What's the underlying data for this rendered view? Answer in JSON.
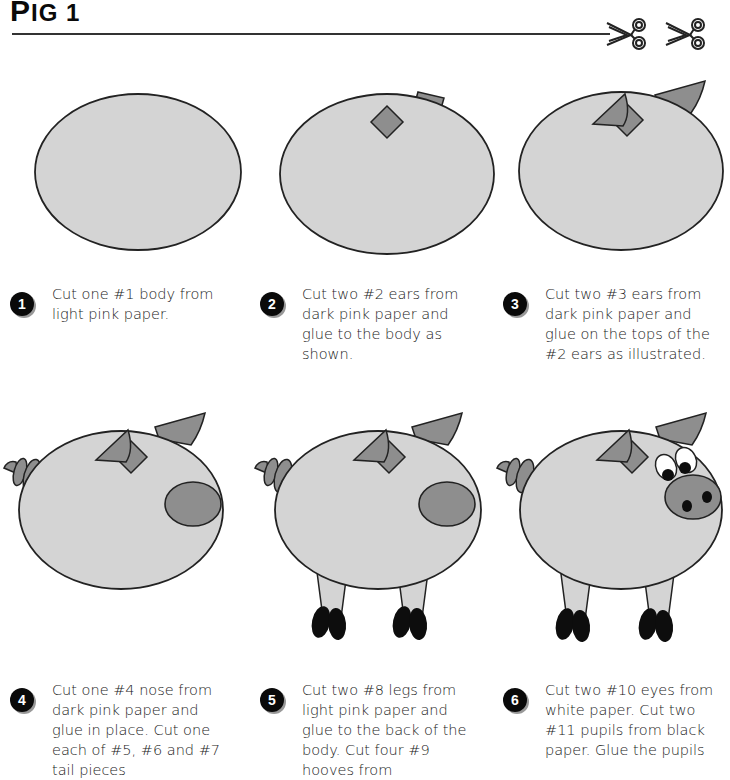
{
  "header": {
    "title_first": "P",
    "title_rest": "IG 1",
    "top_right_text": "..."
  },
  "icons": [
    "scissors-icon",
    "scissors-icon"
  ],
  "colors": {
    "light_pink": "#d4d4d4",
    "dark_pink": "#8e8e8e",
    "outline": "#222222",
    "hoof": "#0d0d0d",
    "eye_white": "#ffffff"
  },
  "steps": [
    {
      "number": "1",
      "text": "Cut one #1 body from light pink paper."
    },
    {
      "number": "2",
      "text": "Cut two #2 ears from dark pink paper and glue to the body as shown."
    },
    {
      "number": "3",
      "text": "Cut two #3 ears from dark pink paper and glue on the tops of the #2 ears as illustrated."
    },
    {
      "number": "4",
      "text": "Cut one #4 nose from dark pink paper and glue in place. Cut one each of #5, #6 and #7 tail pieces"
    },
    {
      "number": "5",
      "text": "Cut two #8 legs from light pink paper and glue to the back of the body. Cut four #9 hooves from"
    },
    {
      "number": "6",
      "text": "Cut two #10 eyes from white paper.  Cut two #11 pupils from black paper.  Glue the pupils"
    }
  ]
}
